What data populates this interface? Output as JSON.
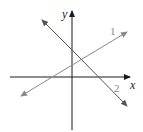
{
  "diagram": {
    "axes": {
      "x_label": "x",
      "y_label": "y",
      "color": "#1a1a1a"
    },
    "lines": [
      {
        "id": "line-1",
        "label": "1",
        "slope": "positive",
        "color": "#8a8a8a"
      },
      {
        "id": "line-2",
        "label": "2",
        "slope": "negative",
        "color": "#444444"
      }
    ]
  }
}
